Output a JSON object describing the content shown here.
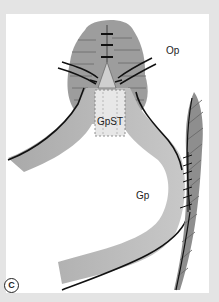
{
  "figure": {
    "panel_marker": "C",
    "labels": {
      "op": "Op",
      "gpst": "GpST",
      "gp": "Gp"
    },
    "colors": {
      "frame": "#e4e4e4",
      "panel": "#ffffff",
      "tissue_dark": "#8a8a8a",
      "tissue_band": "#bdbdbd",
      "outline": "#111111"
    }
  }
}
